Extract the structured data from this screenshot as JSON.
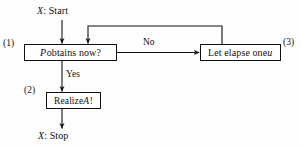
{
  "figure": {
    "type": "flowchart",
    "background_color": "#fdfdfd",
    "line_color": "#111111"
  },
  "terminals": {
    "start": {
      "prefix": "X",
      "separator": ": ",
      "label": "Start"
    },
    "stop": {
      "prefix": "X",
      "separator": ": ",
      "label": "Stop"
    }
  },
  "nodes": {
    "decision": {
      "step": "(1)",
      "text_italic": "P",
      "text_rest": " obtains now?"
    },
    "realize": {
      "step": "(2)",
      "text_prefix": "Realize ",
      "text_italic": "A",
      "text_suffix": "!"
    },
    "elapse": {
      "step": "(3)",
      "text_prefix": "Let elapse one ",
      "text_italic": "u"
    }
  },
  "edges": {
    "no_label": "No",
    "yes_label": "Yes"
  }
}
